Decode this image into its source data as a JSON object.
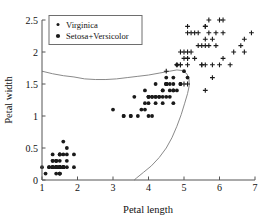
{
  "chart_data": {
    "type": "scatter",
    "title": "",
    "xlabel": "Petal length",
    "ylabel": "Petal width",
    "xlim": [
      1,
      7
    ],
    "ylim": [
      0,
      2.5
    ],
    "xticks": [
      1,
      2,
      3,
      4,
      5,
      6,
      7
    ],
    "yticks": [
      0,
      0.5,
      1,
      1.5,
      2,
      2.5
    ],
    "xtick_labels": [
      "1",
      "2",
      "3",
      "4",
      "5",
      "6",
      "7"
    ],
    "ytick_labels": [
      "0",
      "0.5",
      "1",
      "1.5",
      "2",
      "2.5"
    ],
    "grid": false,
    "legend_position": "top-left",
    "marker_color": "#1a1a1a",
    "boundary_color": "#8a8a8a",
    "series": [
      {
        "name": "Virginica",
        "marker": "plus",
        "points": [
          [
            6.0,
            2.5
          ],
          [
            5.1,
            1.9
          ],
          [
            5.9,
            2.1
          ],
          [
            5.6,
            1.8
          ],
          [
            5.8,
            2.2
          ],
          [
            6.6,
            2.1
          ],
          [
            4.5,
            1.7
          ],
          [
            6.3,
            1.8
          ],
          [
            5.8,
            1.8
          ],
          [
            6.1,
            2.5
          ],
          [
            5.1,
            2.0
          ],
          [
            5.3,
            1.9
          ],
          [
            5.5,
            2.1
          ],
          [
            5.0,
            2.0
          ],
          [
            5.1,
            2.4
          ],
          [
            5.3,
            2.3
          ],
          [
            5.5,
            1.8
          ],
          [
            6.7,
            2.2
          ],
          [
            6.9,
            2.3
          ],
          [
            5.0,
            1.5
          ],
          [
            5.7,
            2.3
          ],
          [
            4.9,
            2.0
          ],
          [
            6.7,
            2.0
          ],
          [
            4.9,
            1.8
          ],
          [
            5.7,
            2.1
          ],
          [
            6.0,
            1.8
          ],
          [
            4.8,
            1.8
          ],
          [
            4.9,
            1.8
          ],
          [
            5.6,
            2.1
          ],
          [
            5.8,
            1.6
          ],
          [
            6.1,
            1.9
          ],
          [
            6.4,
            2.0
          ],
          [
            5.6,
            2.2
          ],
          [
            5.1,
            1.5
          ],
          [
            5.6,
            1.4
          ],
          [
            6.1,
            2.3
          ],
          [
            5.6,
            2.4
          ],
          [
            5.5,
            1.8
          ],
          [
            4.8,
            1.8
          ],
          [
            5.4,
            2.1
          ],
          [
            5.6,
            2.4
          ],
          [
            5.1,
            2.3
          ],
          [
            5.1,
            1.9
          ],
          [
            5.9,
            2.3
          ],
          [
            5.7,
            2.5
          ],
          [
            5.2,
            2.3
          ],
          [
            5.0,
            1.9
          ],
          [
            5.2,
            2.0
          ],
          [
            5.4,
            2.3
          ],
          [
            5.1,
            1.8
          ]
        ]
      },
      {
        "name": "Setosa+Versicolor",
        "marker": "circle",
        "points": [
          [
            1.4,
            0.2
          ],
          [
            1.4,
            0.2
          ],
          [
            1.3,
            0.2
          ],
          [
            1.5,
            0.2
          ],
          [
            1.4,
            0.2
          ],
          [
            1.7,
            0.4
          ],
          [
            1.4,
            0.3
          ],
          [
            1.5,
            0.2
          ],
          [
            1.4,
            0.2
          ],
          [
            1.5,
            0.1
          ],
          [
            1.5,
            0.2
          ],
          [
            1.6,
            0.2
          ],
          [
            1.4,
            0.1
          ],
          [
            1.1,
            0.1
          ],
          [
            1.2,
            0.2
          ],
          [
            1.5,
            0.4
          ],
          [
            1.3,
            0.4
          ],
          [
            1.4,
            0.3
          ],
          [
            1.7,
            0.3
          ],
          [
            1.5,
            0.3
          ],
          [
            1.7,
            0.2
          ],
          [
            1.5,
            0.4
          ],
          [
            1.0,
            0.2
          ],
          [
            1.7,
            0.5
          ],
          [
            1.9,
            0.2
          ],
          [
            1.6,
            0.2
          ],
          [
            1.6,
            0.4
          ],
          [
            1.5,
            0.2
          ],
          [
            1.4,
            0.2
          ],
          [
            1.6,
            0.2
          ],
          [
            1.6,
            0.2
          ],
          [
            1.5,
            0.4
          ],
          [
            1.5,
            0.1
          ],
          [
            1.4,
            0.2
          ],
          [
            1.5,
            0.2
          ],
          [
            1.2,
            0.2
          ],
          [
            1.3,
            0.2
          ],
          [
            1.5,
            0.1
          ],
          [
            1.3,
            0.2
          ],
          [
            1.5,
            0.2
          ],
          [
            1.3,
            0.3
          ],
          [
            1.3,
            0.3
          ],
          [
            1.3,
            0.2
          ],
          [
            1.6,
            0.6
          ],
          [
            1.9,
            0.4
          ],
          [
            1.4,
            0.3
          ],
          [
            1.6,
            0.2
          ],
          [
            1.4,
            0.2
          ],
          [
            1.5,
            0.2
          ],
          [
            1.4,
            0.2
          ],
          [
            4.7,
            1.4
          ],
          [
            4.5,
            1.5
          ],
          [
            4.9,
            1.5
          ],
          [
            4.0,
            1.3
          ],
          [
            4.6,
            1.5
          ],
          [
            4.5,
            1.3
          ],
          [
            4.7,
            1.6
          ],
          [
            3.3,
            1.0
          ],
          [
            4.6,
            1.3
          ],
          [
            3.9,
            1.4
          ],
          [
            3.5,
            1.0
          ],
          [
            4.2,
            1.5
          ],
          [
            4.0,
            1.0
          ],
          [
            4.7,
            1.4
          ],
          [
            3.6,
            1.3
          ],
          [
            4.4,
            1.4
          ],
          [
            4.5,
            1.5
          ],
          [
            4.1,
            1.0
          ],
          [
            4.5,
            1.5
          ],
          [
            3.9,
            1.1
          ],
          [
            4.8,
            1.8
          ],
          [
            4.0,
            1.3
          ],
          [
            4.9,
            1.5
          ],
          [
            4.7,
            1.2
          ],
          [
            4.3,
            1.3
          ],
          [
            4.4,
            1.4
          ],
          [
            4.8,
            1.4
          ],
          [
            5.0,
            1.7
          ],
          [
            4.5,
            1.5
          ],
          [
            3.5,
            1.0
          ],
          [
            3.8,
            1.1
          ],
          [
            3.7,
            1.0
          ],
          [
            3.9,
            1.2
          ],
          [
            5.1,
            1.6
          ],
          [
            4.5,
            1.5
          ],
          [
            4.5,
            1.6
          ],
          [
            4.7,
            1.5
          ],
          [
            4.4,
            1.3
          ],
          [
            4.1,
            1.3
          ],
          [
            4.0,
            1.3
          ],
          [
            4.4,
            1.2
          ],
          [
            4.6,
            1.4
          ],
          [
            4.0,
            1.2
          ],
          [
            3.3,
            1.0
          ],
          [
            4.2,
            1.3
          ],
          [
            4.2,
            1.2
          ],
          [
            4.2,
            1.3
          ],
          [
            4.3,
            1.3
          ],
          [
            3.0,
            1.1
          ],
          [
            4.1,
            1.3
          ]
        ]
      }
    ],
    "boundary_curve": {
      "name": "decision-boundary",
      "description": "separating curve between classes",
      "points": [
        [
          1.0,
          1.7
        ],
        [
          1.3,
          1.66
        ],
        [
          1.6,
          1.63
        ],
        [
          1.9,
          1.61
        ],
        [
          2.2,
          1.58
        ],
        [
          2.5,
          1.57
        ],
        [
          2.8,
          1.57
        ],
        [
          3.1,
          1.58
        ],
        [
          3.4,
          1.6
        ],
        [
          3.7,
          1.62
        ],
        [
          4.0,
          1.64
        ],
        [
          4.3,
          1.67
        ],
        [
          4.6,
          1.7
        ],
        [
          4.8,
          1.72
        ],
        [
          4.95,
          1.71
        ],
        [
          5.08,
          1.66
        ],
        [
          5.14,
          1.58
        ],
        [
          5.15,
          1.48
        ],
        [
          5.1,
          1.35
        ],
        [
          5.02,
          1.2
        ],
        [
          4.92,
          1.02
        ],
        [
          4.8,
          0.84
        ],
        [
          4.66,
          0.66
        ],
        [
          4.5,
          0.5
        ],
        [
          4.3,
          0.35
        ],
        [
          4.08,
          0.22
        ],
        [
          3.86,
          0.12
        ],
        [
          3.66,
          0.03
        ],
        [
          3.6,
          0.0
        ]
      ]
    }
  },
  "legend": {
    "entries": [
      {
        "label": "Virginica",
        "marker": "plus"
      },
      {
        "label": "Setosa+Versicolor",
        "marker": "circle"
      }
    ]
  }
}
